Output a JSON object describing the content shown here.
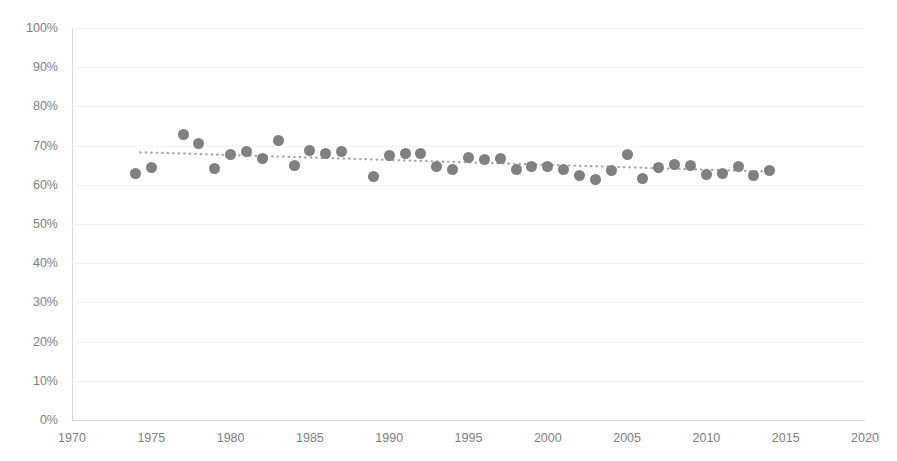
{
  "chart_data": {
    "type": "scatter",
    "title": "",
    "subtitle": "",
    "xlabel": "",
    "ylabel": "",
    "xlim": [
      1970,
      2020
    ],
    "ylim": [
      0,
      100
    ],
    "grid": true,
    "legend": false,
    "y_tick_labels": [
      "100%",
      "90%",
      "80%",
      "70%",
      "60%",
      "50%",
      "40%",
      "30%",
      "20%",
      "10%",
      "0%"
    ],
    "y_tick_values": [
      100,
      90,
      80,
      70,
      60,
      50,
      40,
      30,
      20,
      10,
      0
    ],
    "x_tick_labels": [
      "1970",
      "1975",
      "1980",
      "1985",
      "1990",
      "1995",
      "2000",
      "2005",
      "2010",
      "2015",
      "2020"
    ],
    "x_tick_values": [
      1970,
      1975,
      1980,
      1985,
      1990,
      1995,
      2000,
      2005,
      2010,
      2015,
      2020
    ],
    "marker_color": "#808080",
    "trendline_color": "#a6a6a6",
    "grid_color": "#f2f2f2",
    "axis_color": "#d9d9d9",
    "background_color": "#ffffff",
    "series": [
      {
        "name": "Percent",
        "marker": "circle",
        "x": [
          1974,
          1975,
          1977,
          1978,
          1979,
          1980,
          1981,
          1982,
          1983,
          1984,
          1985,
          1986,
          1987,
          1989,
          1990,
          1991,
          1992,
          1993,
          1994,
          1995,
          1996,
          1997,
          1998,
          1999,
          2000,
          2001,
          2002,
          2003,
          2004,
          2005,
          2006,
          2007,
          2008,
          2009,
          2010,
          2011,
          2012,
          2013,
          2014
        ],
        "y": [
          62.8,
          64.5,
          72.8,
          70.6,
          64.2,
          67.8,
          68.4,
          66.6,
          71.4,
          64.8,
          68.8,
          68.0,
          68.6,
          62.2,
          67.4,
          68.0,
          68.0,
          64.6,
          63.8,
          67.0,
          66.4,
          66.8,
          63.8,
          64.6,
          64.6,
          64.0,
          62.4,
          61.4,
          63.6,
          67.8,
          61.6,
          64.4,
          65.2,
          65.0,
          62.6,
          62.8,
          64.6,
          62.4,
          63.6
        ]
      }
    ],
    "trendline": {
      "type": "linear-dotted",
      "x_start": 1974.3,
      "y_start": 68.3,
      "x_end": 2014.4,
      "y_end": 63.3
    }
  }
}
